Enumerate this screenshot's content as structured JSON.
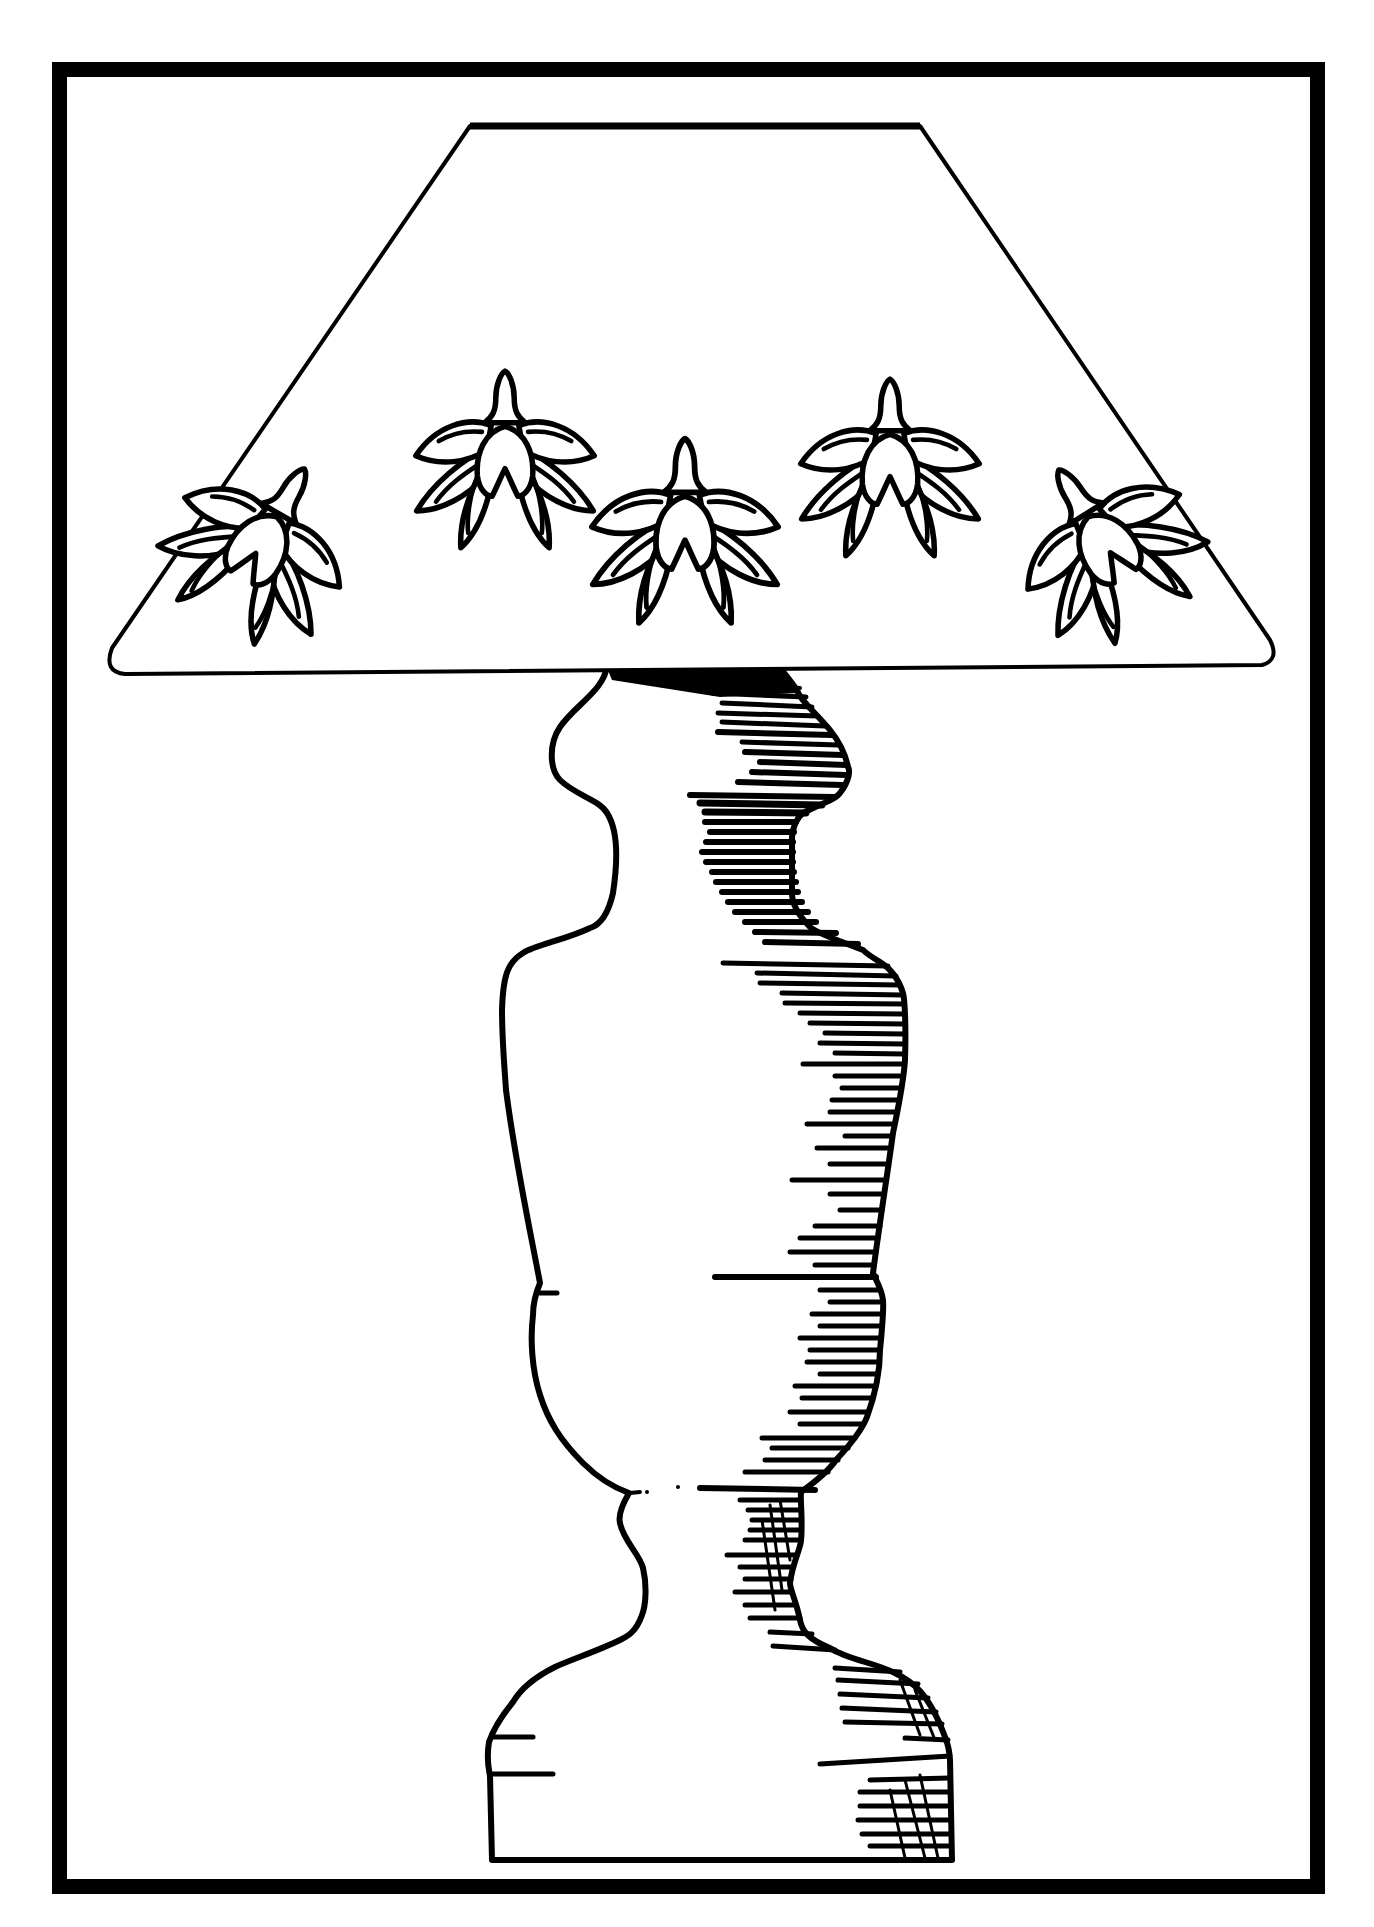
{
  "illustration": {
    "subject": "Table lamp line drawing",
    "style": "black ink line art on white",
    "colors": {
      "ink": "#000000",
      "paper": "#ffffff"
    },
    "frame": {
      "x": 52,
      "y": 62,
      "width": 1273,
      "height": 1832,
      "thickness": 15
    },
    "lampshade": {
      "shape": "trapezoid with rounded bottom corners",
      "top_edge": {
        "x1": 470,
        "x2": 920,
        "y": 127
      },
      "bottom_edge": {
        "x1": 111,
        "x2": 1274,
        "y": 672
      },
      "motif_count": 5,
      "motif": "stylized leafy flower / lotus bud"
    },
    "base": {
      "shape": "turned baluster lamp body",
      "shading": "horizontal ink hatching along right side",
      "foot_bottom_y": 1860
    }
  }
}
